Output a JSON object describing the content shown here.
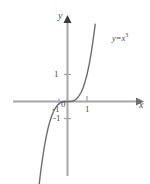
{
  "figure": {
    "name": "cubic-function-graph",
    "background_color": "#ffffff",
    "axis_color": "#a6a6a6",
    "curve_color": "#6e6e6e",
    "text_color": "#4a4a4a"
  },
  "axes": {
    "x_axis_label": "x",
    "y_axis_label": "y",
    "origin_label": "0",
    "x_ticks": [
      {
        "value": -1,
        "label": "-1"
      },
      {
        "value": 1,
        "label": "1"
      }
    ],
    "y_ticks": [
      {
        "value": 1,
        "label": "1"
      },
      {
        "value": -1,
        "label": "-1"
      }
    ],
    "x_range": [
      -2.7,
      3.4
    ],
    "y_range": [
      -4.4,
      2.9
    ],
    "grid": false,
    "arrowheads": [
      "x-positive",
      "y-positive"
    ]
  },
  "curve": {
    "equation_label_parts": {
      "y": "y",
      "op": "=",
      "x": "x",
      "exponent": "3"
    },
    "equation_plain": "y = x^3",
    "function": "y = x^3"
  },
  "chart_data": {
    "type": "line",
    "title": "",
    "xlabel": "x",
    "ylabel": "y",
    "xlim": [
      -2.7,
      3.4
    ],
    "ylim": [
      -4.4,
      2.9
    ],
    "grid": false,
    "legend": "none",
    "annotations": [
      {
        "text": "y = x^3",
        "x": 2.3,
        "y": 2.1
      }
    ],
    "series": [
      {
        "name": "y = x^3",
        "color": "#6e6e6e",
        "x": [
          -1.62,
          -1.5,
          -1.4,
          -1.3,
          -1.2,
          -1.1,
          -1.0,
          -0.9,
          -0.8,
          -0.7,
          -0.6,
          -0.5,
          -0.4,
          -0.3,
          -0.2,
          -0.1,
          0.0,
          0.1,
          0.2,
          0.3,
          0.4,
          0.5,
          0.6,
          0.7,
          0.8,
          0.9,
          1.0,
          1.1,
          1.2,
          1.3,
          1.4,
          1.42
        ],
        "y": [
          -4.25,
          -3.375,
          -2.744,
          -2.197,
          -1.728,
          -1.331,
          -1.0,
          -0.729,
          -0.512,
          -0.343,
          -0.216,
          -0.125,
          -0.064,
          -0.027,
          -0.008,
          -0.001,
          0.0,
          0.001,
          0.008,
          0.027,
          0.064,
          0.125,
          0.216,
          0.343,
          0.512,
          0.729,
          1.0,
          1.331,
          1.728,
          2.197,
          2.744,
          2.86
        ]
      }
    ]
  }
}
